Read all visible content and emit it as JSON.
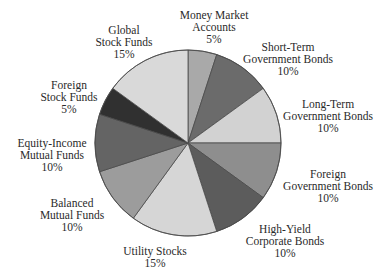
{
  "chart_data": {
    "type": "pie",
    "title": "",
    "start_angle": "12 o'clock",
    "direction": "clockwise",
    "legend": "none (direct labels)",
    "slices": [
      {
        "name": "Money Market Accounts",
        "lines": [
          "Money Market",
          "Accounts",
          "5%"
        ],
        "value": 5,
        "color": "#a9a9a9",
        "label_pos": [
          214,
          9
        ]
      },
      {
        "name": "Short-Term Government Bonds",
        "lines": [
          "Short-Term",
          "Government Bonds",
          "10%"
        ],
        "value": 10,
        "color": "#6b6b6b",
        "label_pos": [
          288,
          41
        ]
      },
      {
        "name": "Long-Term Government Bonds",
        "lines": [
          "Long-Term",
          "Government Bonds",
          "10%"
        ],
        "value": 10,
        "color": "#d2d2d2",
        "label_pos": [
          328,
          98
        ]
      },
      {
        "name": "Foreign Government Bonds",
        "lines": [
          "Foreign",
          "Government Bonds",
          "10%"
        ],
        "value": 10,
        "color": "#8e8e8e",
        "label_pos": [
          328,
          168
        ]
      },
      {
        "name": "High-Yield Corporate Bonds",
        "lines": [
          "High-Yield",
          "Corporate Bonds",
          "10%"
        ],
        "value": 10,
        "color": "#5c5c5c",
        "label_pos": [
          285,
          223
        ]
      },
      {
        "name": "Utility Stocks",
        "lines": [
          "Utility Stocks",
          "15%"
        ],
        "value": 15,
        "color": "#d6d6d6",
        "label_pos": [
          155,
          245
        ]
      },
      {
        "name": "Balanced Mutual Funds",
        "lines": [
          "Balanced",
          "Mutual Funds",
          "10%"
        ],
        "value": 10,
        "color": "#9c9c9c",
        "label_pos": [
          72,
          197
        ]
      },
      {
        "name": "Equity-Income Mutual Funds",
        "lines": [
          "Equity-Income",
          "Mutual Funds",
          "10%"
        ],
        "value": 10,
        "color": "#646464",
        "label_pos": [
          52,
          137
        ]
      },
      {
        "name": "Foreign Stock Funds",
        "lines": [
          "Foreign",
          "Stock Funds",
          "5%"
        ],
        "value": 5,
        "color": "#303030",
        "label_pos": [
          69,
          79
        ]
      },
      {
        "name": "Global Stock Funds",
        "lines": [
          "Global",
          "Stock Funds",
          "15%"
        ],
        "value": 15,
        "color": "#d9d9d9",
        "label_pos": [
          124,
          24
        ]
      }
    ]
  },
  "layout": {
    "center": [
      188,
      143
    ],
    "radius": 93,
    "stroke": "#4a4a4a"
  }
}
